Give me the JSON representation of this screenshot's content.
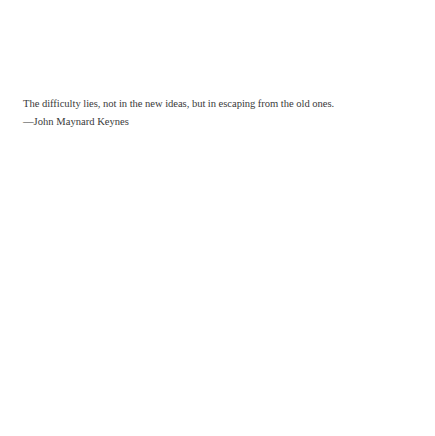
{
  "quote": {
    "text": "The difficulty lies, not in the new ideas, but in escaping from the old ones.",
    "attribution": "—John Maynard Keynes"
  }
}
